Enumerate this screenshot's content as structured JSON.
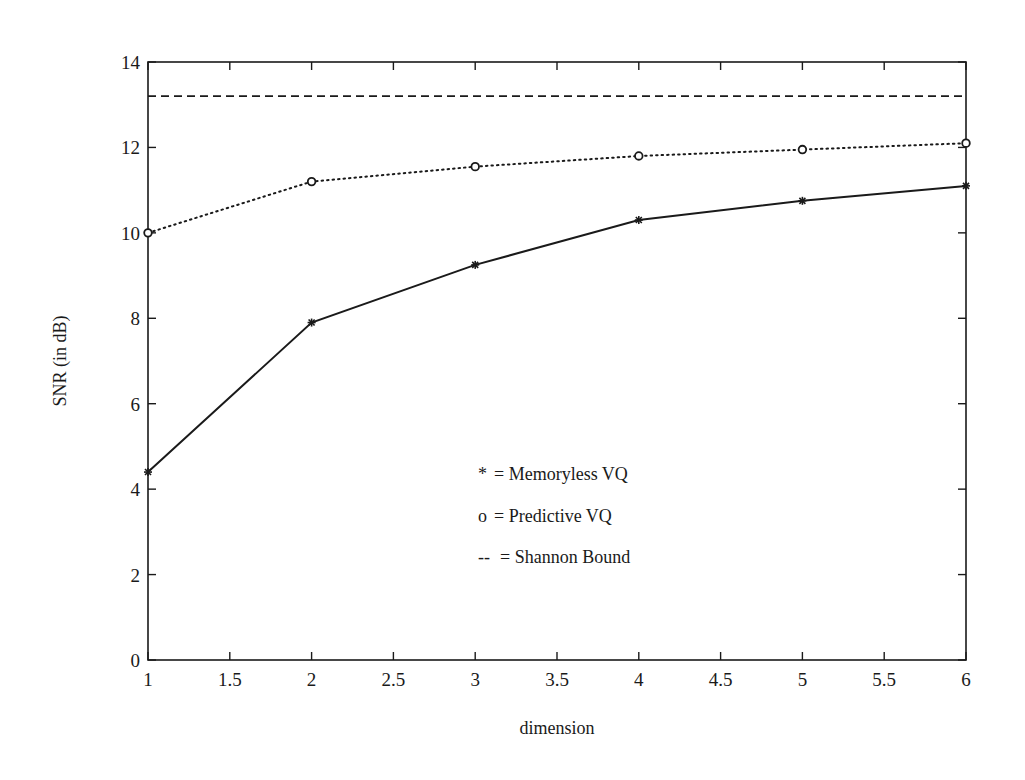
{
  "chart_data": {
    "type": "line",
    "title": "",
    "xlabel": "dimension",
    "ylabel": "SNR (in dB)",
    "xlim": [
      1,
      6
    ],
    "ylim": [
      0,
      14
    ],
    "grid": false,
    "legend_position": "inside-center",
    "x": [
      1,
      2,
      3,
      4,
      5,
      6
    ],
    "x_ticks": [
      "1",
      "1.5",
      "2",
      "2.5",
      "3",
      "3.5",
      "4",
      "4.5",
      "5",
      "5.5",
      "6"
    ],
    "y_ticks": [
      "0",
      "2",
      "4",
      "6",
      "8",
      "10",
      "12",
      "14"
    ],
    "series": [
      {
        "name": "Memoryless VQ",
        "marker": "*",
        "line_style": "solid",
        "values": [
          4.4,
          7.9,
          9.25,
          10.3,
          10.75,
          11.1
        ]
      },
      {
        "name": "Predictive VQ",
        "marker": "o",
        "line_style": "dotted",
        "values": [
          10.0,
          11.2,
          11.55,
          11.8,
          11.95,
          12.1
        ]
      },
      {
        "name": "Shannon Bound",
        "marker": "none",
        "line_style": "dashed",
        "values": [
          13.2,
          13.2,
          13.2,
          13.2,
          13.2,
          13.2
        ]
      }
    ],
    "legend": [
      {
        "symbol": "*",
        "label": "= Memoryless VQ"
      },
      {
        "symbol": "o",
        "label": "= Predictive VQ"
      },
      {
        "symbol": "--",
        "label": "= Shannon Bound"
      }
    ]
  },
  "colors": {
    "ink": "#1a1a1a",
    "background": "#ffffff"
  }
}
